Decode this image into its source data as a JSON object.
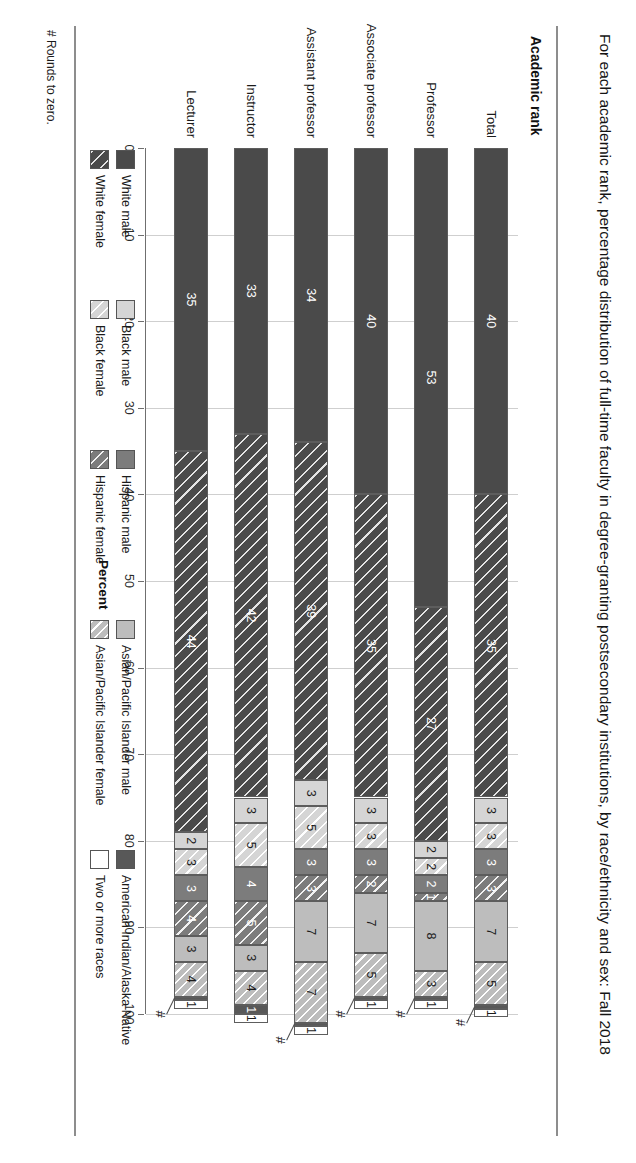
{
  "title": "For each academic rank, percentage distribution of full-time faculty in degree-granting postsecondary institutions, by race/ethnicity and sex: Fall 2018",
  "axis": {
    "y_title": "Academic rank",
    "x_title": "Percent"
  },
  "footnote": "# Rounds to zero.",
  "hash_marker": "#",
  "legend": {
    "items": [
      {
        "label": "White male",
        "key": "white_male",
        "fill": "f-white-m"
      },
      {
        "label": "White female",
        "key": "white_female",
        "fill": "f-white-f"
      },
      {
        "label": "Black male",
        "key": "black_male",
        "fill": "f-black-m"
      },
      {
        "label": "Black female",
        "key": "black_female",
        "fill": "f-black-f"
      },
      {
        "label": "Hispanic male",
        "key": "hispanic_male",
        "fill": "f-hisp-m"
      },
      {
        "label": "Hispanic female",
        "key": "hispanic_female",
        "fill": "f-hisp-f"
      },
      {
        "label": "Asian/Pacific Islander male",
        "key": "api_male",
        "fill": "f-api-m"
      },
      {
        "label": "Asian/Pacific Islander female",
        "key": "api_female",
        "fill": "f-api-f"
      },
      {
        "label": "American Indian/Alaska Native",
        "key": "aian",
        "fill": "f-aian"
      },
      {
        "label": "Two or more races",
        "key": "two_or_more",
        "fill": "f-two"
      }
    ]
  },
  "chart_data": {
    "type": "bar",
    "orientation": "horizontal",
    "stacked": true,
    "title": "For each academic rank, percentage distribution of full-time faculty in degree-granting postsecondary institutions, by race/ethnicity and sex: Fall 2018",
    "xlabel": "Percent",
    "ylabel": "Academic rank",
    "xlim": [
      0,
      100
    ],
    "xticks": [
      0,
      10,
      20,
      30,
      40,
      50,
      60,
      70,
      80,
      90,
      100
    ],
    "grid": true,
    "legend_position": "bottom",
    "categories": [
      "Total",
      "Professor",
      "Associate professor",
      "Assistant professor",
      "Instructor",
      "Lecturer"
    ],
    "series": [
      {
        "name": "White male",
        "values": [
          40,
          53,
          40,
          34,
          33,
          35
        ],
        "labels": [
          "40",
          "53",
          "40",
          "34",
          "33",
          "35"
        ]
      },
      {
        "name": "White female",
        "values": [
          35,
          27,
          35,
          39,
          42,
          44
        ],
        "labels": [
          "35",
          "27",
          "35",
          "39",
          "42",
          "44"
        ]
      },
      {
        "name": "Black male",
        "values": [
          3,
          2,
          3,
          3,
          3,
          2
        ],
        "labels": [
          "3",
          "2",
          "3",
          "3",
          "3",
          "2"
        ]
      },
      {
        "name": "Black female",
        "values": [
          3,
          2,
          3,
          5,
          5,
          3
        ],
        "labels": [
          "3",
          "2",
          "3",
          "5",
          "5",
          "3"
        ]
      },
      {
        "name": "Hispanic male",
        "values": [
          3,
          2,
          3,
          3,
          4,
          3
        ],
        "labels": [
          "3",
          "2",
          "3",
          "3",
          "4",
          "3"
        ]
      },
      {
        "name": "Hispanic female",
        "values": [
          3,
          1,
          2,
          3,
          5,
          4
        ],
        "labels": [
          "3",
          "1",
          "2",
          "3",
          "5",
          "4"
        ]
      },
      {
        "name": "Asian/Pacific Islander male",
        "values": [
          7,
          8,
          7,
          7,
          3,
          3
        ],
        "labels": [
          "7",
          "8",
          "7",
          "7",
          "3",
          "3"
        ]
      },
      {
        "name": "Asian/Pacific Islander female",
        "values": [
          5,
          3,
          5,
          7,
          4,
          4
        ],
        "labels": [
          "5",
          "3",
          "5",
          "7",
          "4",
          "4"
        ]
      },
      {
        "name": "American Indian/Alaska Native",
        "values": [
          0.4,
          0.4,
          0.4,
          0.4,
          1,
          0.4
        ],
        "labels": [
          "#",
          "#",
          "#",
          "#",
          "1",
          "#"
        ]
      },
      {
        "name": "Two or more races",
        "values": [
          1,
          1,
          1,
          1,
          1,
          1
        ],
        "labels": [
          "1",
          "1",
          "1",
          "1",
          "1",
          "1"
        ]
      }
    ]
  }
}
